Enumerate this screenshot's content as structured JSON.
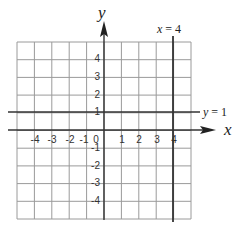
{
  "chart_data": {
    "type": "line",
    "title": "",
    "xlabel": "x",
    "ylabel": "y",
    "xlim": [
      -5,
      5
    ],
    "ylim": [
      -5,
      5
    ],
    "grid": true,
    "x_ticks": [
      "-4",
      "-3",
      "-2",
      "-1",
      "0",
      "1",
      "2",
      "3",
      "4"
    ],
    "y_ticks": [
      "4",
      "3",
      "2",
      "1",
      "-1",
      "-2",
      "-3",
      "-4"
    ],
    "series": [
      {
        "name": "x = 4",
        "type": "vertical",
        "value": 4
      },
      {
        "name": "y = 1",
        "type": "horizontal",
        "value": 1
      }
    ]
  },
  "labels": {
    "x_axis": "x",
    "y_axis": "y",
    "vline": {
      "var": "x",
      "eq": " = 4"
    },
    "hline": {
      "var": "y",
      "eq": " = 1"
    }
  },
  "ticks": {
    "x": [
      {
        "label": "-4",
        "px": 35
      },
      {
        "label": "-3",
        "px": 52
      },
      {
        "label": "-2",
        "px": 70
      },
      {
        "label": "-1",
        "px": 84
      },
      {
        "label": "0",
        "px": 96
      },
      {
        "label": "1",
        "px": 122
      },
      {
        "label": "2",
        "px": 139
      },
      {
        "label": "3",
        "px": 157
      },
      {
        "label": "4",
        "px": 174
      }
    ],
    "y": [
      {
        "label": "4",
        "py": 62
      },
      {
        "label": "3",
        "py": 80
      },
      {
        "label": "2",
        "py": 98
      },
      {
        "label": "1",
        "py": 115
      },
      {
        "label": "-1",
        "py": 151
      },
      {
        "label": "-2",
        "py": 169
      },
      {
        "label": "-3",
        "py": 186
      },
      {
        "label": "-4",
        "py": 204
      }
    ]
  }
}
